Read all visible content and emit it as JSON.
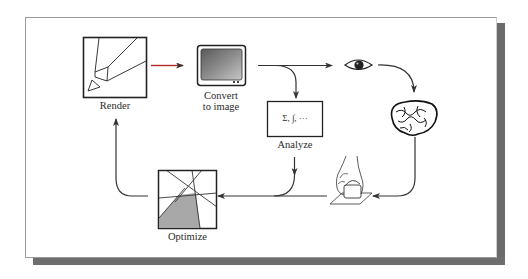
{
  "diagram": {
    "type": "cycle-flowchart",
    "nodes": [
      {
        "id": "render",
        "label": "Render",
        "icon": "pencil-icon"
      },
      {
        "id": "convert",
        "label_line1": "Convert",
        "label_line2": "to image",
        "icon": "monitor-icon"
      },
      {
        "id": "analyze",
        "label": "Analyze",
        "box_text": "Σ, ∫, ···",
        "icon": "math-box-icon"
      },
      {
        "id": "eye",
        "label": "",
        "icon": "eye-icon"
      },
      {
        "id": "brain",
        "label": "",
        "icon": "brain-icon"
      },
      {
        "id": "hand",
        "label": "",
        "icon": "hand-pressing-button-icon"
      },
      {
        "id": "optimize",
        "label": "Optimize",
        "icon": "linear-program-polygon-icon"
      }
    ],
    "edges": [
      {
        "from": "render",
        "to": "convert",
        "color": "#b02a2a"
      },
      {
        "from": "convert",
        "to": "eye",
        "color": "#333333"
      },
      {
        "from": "convert",
        "to": "analyze",
        "color": "#333333"
      },
      {
        "from": "eye",
        "to": "brain",
        "color": "#333333"
      },
      {
        "from": "brain",
        "to": "hand",
        "color": "#333333"
      },
      {
        "from": "hand",
        "to": "optimize",
        "color": "#333333"
      },
      {
        "from": "analyze",
        "to": "optimize",
        "color": "#333333"
      },
      {
        "from": "optimize",
        "to": "render",
        "color": "#333333"
      }
    ]
  },
  "colors": {
    "frame_shadow": "#6b6b6b",
    "accent_arrow": "#b02a2a",
    "line": "#333333",
    "polygon_fill": "#a8a8a8"
  }
}
